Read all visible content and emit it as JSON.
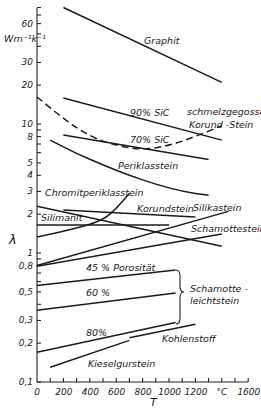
{
  "chart_data": {
    "type": "line",
    "title": "",
    "xlabel": "T",
    "x_unit": "°C",
    "ylabel": "λ",
    "y_unit": "W m⁻¹ K⁻¹",
    "yscale": "log",
    "xlim": [
      0,
      1600
    ],
    "ylim": [
      0.1,
      90
    ],
    "grid": false,
    "x_ticks": [
      "0",
      "200",
      "400",
      "600",
      "800",
      "1000",
      "1200",
      "°C",
      "1600"
    ],
    "y_ticks": [
      "60",
      "30",
      "20",
      "10",
      "8",
      "5",
      "4",
      "3",
      "2",
      "1",
      "0,8",
      "0,5",
      "0,3",
      "0,2",
      "0,1"
    ],
    "series": [
      {
        "name": "Graphit",
        "style": "solid",
        "x": [
          200,
          1400
        ],
        "y": [
          80,
          21
        ]
      },
      {
        "name": "90 % SiC",
        "style": "solid",
        "x": [
          200,
          1400
        ],
        "y": [
          15.9,
          7.5
        ]
      },
      {
        "name": "70 % SiC",
        "style": "solid",
        "x": [
          200,
          1300
        ],
        "y": [
          8.2,
          5.3
        ]
      },
      {
        "name": "schmelzgegossener Korund-Stein",
        "style": "dashed",
        "x": [
          0,
          200,
          400,
          600,
          800,
          1000,
          1200,
          1400
        ],
        "y": [
          16.2,
          11.0,
          8.0,
          6.8,
          6.3,
          6.8,
          8.0,
          9.7
        ]
      },
      {
        "name": "Periklasstein",
        "style": "solid",
        "x": [
          100,
          300,
          500,
          700,
          900,
          1100,
          1300
        ],
        "y": [
          7.5,
          5.9,
          4.8,
          4.0,
          3.4,
          3.0,
          2.8
        ]
      },
      {
        "name": "Chromitperiklasstein",
        "style": "solid",
        "x": [
          0,
          1400
        ],
        "y": [
          2.3,
          1.13
        ]
      },
      {
        "name": "Korundstein",
        "style": "solid",
        "x": [
          200,
          1200
        ],
        "y": [
          2.15,
          1.9
        ]
      },
      {
        "name": "Silimanit",
        "style": "solid",
        "x": [
          0,
          1000
        ],
        "y": [
          1.65,
          1.65
        ]
      },
      {
        "name": "Silikastein (steil)",
        "style": "solid",
        "x": [
          0,
          300,
          500,
          600,
          700
        ],
        "y": [
          1.33,
          1.55,
          1.8,
          2.2,
          2.9
        ]
      },
      {
        "name": "Silikastein",
        "style": "solid",
        "x": [
          0,
          1450
        ],
        "y": [
          0.8,
          2.1
        ]
      },
      {
        "name": "Schamottestein",
        "style": "solid",
        "x": [
          0,
          1400
        ],
        "y": [
          0.79,
          1.4
        ]
      },
      {
        "name": "45 % Porosität",
        "style": "solid",
        "x": [
          0,
          1050
        ],
        "y": [
          0.56,
          0.74
        ]
      },
      {
        "name": "60 %",
        "style": "solid",
        "x": [
          0,
          1050
        ],
        "y": [
          0.36,
          0.49
        ]
      },
      {
        "name": "80 %",
        "style": "solid",
        "x": [
          0,
          1050
        ],
        "y": [
          0.17,
          0.29
        ]
      },
      {
        "name": "Kohlenstoff",
        "style": "solid",
        "x": [
          700,
          1200
        ],
        "y": [
          0.22,
          0.28
        ]
      },
      {
        "name": "Kieselgurstein",
        "style": "solid",
        "x": [
          100,
          700
        ],
        "y": [
          0.13,
          0.21
        ]
      }
    ],
    "annotations": [
      {
        "text": "Schamotte-leichtstein",
        "groups": [
          "45 % Porosität",
          "60 %",
          "80 %"
        ]
      }
    ]
  },
  "labels": {
    "y_unit": "Wm⁻¹k⁻¹",
    "y_axis": "λ",
    "x_axis": "T",
    "graphit": "Graphit",
    "sic90": "90% SiC",
    "sic70": "70% SiC",
    "schmelz1": "schmelzgegossener",
    "schmelz2": "Korund -Stein",
    "periklas": "Periklasstein",
    "chromit": "Chromitperiklasstein",
    "korund": "Korundstein",
    "silimanit": "Silimanit",
    "silika": "Silikastein",
    "schamotte": "Schamottestein",
    "p45": "45 % Porosität",
    "p60": "60 %",
    "p80": "80%",
    "leicht1": "Schamotte -",
    "leicht2": "leichtstein",
    "kohle": "Kohlenstoff",
    "kiesel": "Kieselgurstein"
  }
}
